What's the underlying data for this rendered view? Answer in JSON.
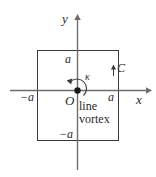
{
  "figure": {
    "background_color": "#ffffff",
    "line_color": "#3a3a3a",
    "text_color": "#2b2b2b",
    "axes": {
      "x_label": "x",
      "y_label": "y",
      "origin_label": "O"
    },
    "ticks": {
      "x_negative": "−a",
      "x_positive": "a",
      "y_positive": "a",
      "y_negative": "−a"
    },
    "contour": {
      "label": "C",
      "direction_icon": "up-arrow-icon"
    },
    "vortex": {
      "strength_label": "κ",
      "caption_line1": "line",
      "caption_line2": "vortex",
      "marker_icon": "filled-dot-icon",
      "circulation_icon": "counterclockwise-arc-arrow-icon"
    }
  }
}
